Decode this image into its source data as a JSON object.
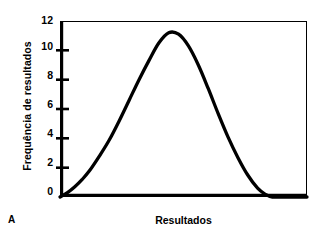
{
  "panel": {
    "label": "A"
  },
  "chart_data": {
    "type": "line",
    "title": "",
    "subtitle": "",
    "xlabel": "Resultados",
    "ylabel": "Frequência de resultados",
    "ylim": [
      0,
      12
    ],
    "xlim": [
      0,
      100
    ],
    "yticks": [
      12,
      10,
      8,
      6,
      4,
      2,
      0
    ],
    "ytick_labels": [
      "12",
      "10",
      "8",
      "6",
      "4",
      "2",
      "0"
    ],
    "xticks": [],
    "xtick_labels": [],
    "grid": false,
    "legend": false,
    "legend_position": "none",
    "annotations": [],
    "series": [
      {
        "name": "Distribuição de frequência",
        "line_color": "#000000",
        "line_width": 3,
        "x": [
          0,
          3,
          6,
          9,
          12,
          16,
          20,
          24,
          28,
          32,
          36,
          40,
          44,
          48,
          52,
          56,
          60,
          64,
          68,
          72,
          76,
          80,
          83,
          86,
          90,
          100
        ],
        "values": [
          0.0,
          0.3,
          0.7,
          1.2,
          1.8,
          2.8,
          3.9,
          5.2,
          6.6,
          8.0,
          9.3,
          10.5,
          11.2,
          11.1,
          10.3,
          9.0,
          7.4,
          5.7,
          4.1,
          2.7,
          1.5,
          0.6,
          0.2,
          0.0,
          0.0,
          0.0
        ]
      }
    ],
    "peak": {
      "x": 44,
      "y": 11.2
    }
  }
}
